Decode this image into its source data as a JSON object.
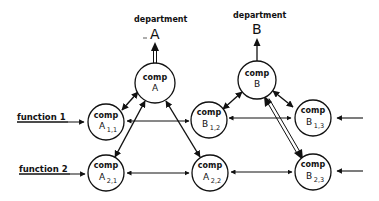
{
  "diagram": {
    "departments": [
      {
        "id": "A",
        "title": "department",
        "letter": "A"
      },
      {
        "id": "B",
        "title": "department",
        "letter": "B"
      }
    ],
    "functions": [
      {
        "id": "f1",
        "label": "function  1"
      },
      {
        "id": "f2",
        "label": "function  2"
      }
    ],
    "nodes": [
      {
        "id": "compA",
        "word": "comp",
        "letter": "A",
        "sub": ""
      },
      {
        "id": "compB",
        "word": "comp",
        "letter": "B",
        "sub": ""
      },
      {
        "id": "compA11",
        "word": "comp",
        "letter": "A",
        "sub": "1,1"
      },
      {
        "id": "compB12",
        "word": "comp",
        "letter": "B",
        "sub": "1,2"
      },
      {
        "id": "compB13",
        "word": "comp",
        "letter": "B",
        "sub": "1,3"
      },
      {
        "id": "compA21",
        "word": "comp",
        "letter": "A",
        "sub": "2,1"
      },
      {
        "id": "compA22",
        "word": "comp",
        "letter": "A",
        "sub": "2,2"
      },
      {
        "id": "compB23",
        "word": "comp",
        "letter": "B",
        "sub": "2,3"
      }
    ],
    "edges": [
      {
        "from": "compA",
        "to": "departmentA",
        "type": "double-line-arrow"
      },
      {
        "from": "compB",
        "to": "departmentB",
        "type": "single-arrow"
      },
      {
        "from": "compA",
        "to": "compA11",
        "type": "bidirectional"
      },
      {
        "from": "compA",
        "to": "compA21",
        "type": "bidirectional"
      },
      {
        "from": "compA",
        "to": "compA22",
        "type": "bidirectional"
      },
      {
        "from": "compB",
        "to": "compB12",
        "type": "bidirectional"
      },
      {
        "from": "compB",
        "to": "compB13",
        "type": "bidirectional"
      },
      {
        "from": "compB",
        "to": "compB23",
        "type": "double-line-arrow"
      },
      {
        "from": "compA11",
        "to": "compB12",
        "type": "bidirectional"
      },
      {
        "from": "compB12",
        "to": "compB13",
        "type": "bidirectional"
      },
      {
        "from": "compA21",
        "to": "compA22",
        "type": "bidirectional"
      },
      {
        "from": "compA22",
        "to": "compB23",
        "type": "bidirectional"
      },
      {
        "from": "function1",
        "to": "compA11",
        "type": "input-arrow"
      },
      {
        "from": "function2",
        "to": "compA21",
        "type": "input-arrow"
      },
      {
        "from": "external",
        "to": "compB13",
        "type": "input-arrow"
      },
      {
        "from": "external",
        "to": "compB23",
        "type": "input-arrow"
      }
    ]
  }
}
